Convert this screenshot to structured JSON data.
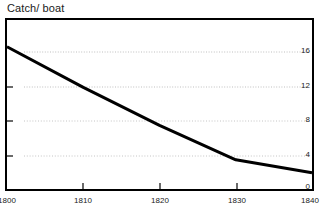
{
  "chart_data": {
    "type": "line",
    "title": "Catch/ boat",
    "xlabel": "",
    "ylabel": "",
    "x": [
      1800,
      1810,
      1820,
      1830,
      1840
    ],
    "values": [
      16.6,
      11.9,
      7.5,
      3.5,
      2.0
    ],
    "series": [
      {
        "name": "Catch per boat",
        "values": [
          16.6,
          11.9,
          7.5,
          3.5,
          2.0
        ]
      }
    ],
    "xlim": [
      1800,
      1840
    ],
    "ylim": [
      0,
      18
    ],
    "xticks": [
      1800,
      1810,
      1820,
      1830,
      1840
    ],
    "xtick_labels": [
      "1800",
      "1810",
      "1820",
      "1830",
      "1840"
    ],
    "yticks": [
      0,
      4,
      8,
      12,
      16
    ],
    "ytick_labels": [
      "16",
      "12",
      "8",
      "4",
      "0"
    ],
    "ytick_label_position": "inside-right",
    "grid": true,
    "grid_style": "dotted",
    "grid_color": "#bfbfbf",
    "grid_levels": [
      16,
      12,
      8,
      4
    ],
    "legend": "none",
    "line_color": "#000000",
    "line_width": 3,
    "frame_color": "#000000",
    "background": "#ffffff"
  },
  "axis": {
    "y_labels": [
      {
        "text": "16",
        "top": 46
      },
      {
        "text": "12",
        "top": 81
      },
      {
        "text": "8",
        "top": 115
      },
      {
        "text": "4",
        "top": 150
      },
      {
        "text": "0",
        "top": 182
      }
    ],
    "x_labels": [
      {
        "text": "1800",
        "left": -10
      },
      {
        "text": "1810",
        "left": 66
      },
      {
        "text": "1820",
        "left": 143
      },
      {
        "text": "1830",
        "left": 220
      },
      {
        "text": "1840",
        "left": 293
      }
    ]
  }
}
